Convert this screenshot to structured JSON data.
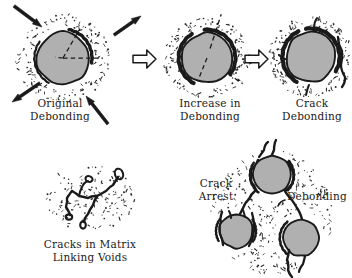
{
  "figure": {
    "background_color": "#ffffff",
    "ink_color": "#1a1a1a",
    "particle_fill": "#b0b0b0",
    "void_color": "#2b2b2b",
    "width": 352,
    "height": 278
  },
  "panels": [
    {
      "id": "original-debonding",
      "caption_line1": "Original",
      "caption_line2": "Debonding",
      "caption_x": 26,
      "caption_y": 97,
      "caption_width": 68,
      "particle": {
        "cx": 63,
        "cy": 58,
        "r": 26
      },
      "void_field": {
        "cx": 63,
        "cy": 58,
        "rx": 48,
        "ry": 44,
        "count": 150
      },
      "debond_arcs": [
        {
          "start_angle": -78,
          "end_angle": 10,
          "offset": 3.0,
          "weight": 3.4
        },
        {
          "start_angle": 120,
          "end_angle": 215,
          "offset": 2.6,
          "weight": 2.2
        }
      ],
      "dashed_lines": [
        {
          "angle": -60,
          "length": 34
        },
        {
          "angle": 0,
          "length": 40
        },
        {
          "angle": 186,
          "length": 8
        }
      ],
      "load_arrows": [
        {
          "x1": 14,
          "y1": 6,
          "x2": 42,
          "y2": 27,
          "dir": "in"
        },
        {
          "x1": 40,
          "y1": 83,
          "x2": 12,
          "y2": 102,
          "dir": "out"
        },
        {
          "x1": 114,
          "y1": 35,
          "x2": 141,
          "y2": 16,
          "dir": "out"
        },
        {
          "x1": 108,
          "y1": 124,
          "x2": 86,
          "y2": 96,
          "dir": "in"
        }
      ]
    },
    {
      "id": "increase-in-debonding",
      "caption_line1": "Increase in",
      "caption_line2": "Debonding",
      "caption_x": 174,
      "caption_y": 97,
      "caption_width": 72,
      "particle": {
        "cx": 207,
        "cy": 58,
        "r": 25
      },
      "void_field": {
        "cx": 207,
        "cy": 58,
        "rx": 44,
        "ry": 40,
        "count": 140
      },
      "debond_arcs": [
        {
          "start_angle": -95,
          "end_angle": 35,
          "offset": 3.4,
          "weight": 4.0
        },
        {
          "start_angle": 118,
          "end_angle": 238,
          "offset": 3.4,
          "weight": 4.0
        }
      ],
      "dashed_lines": [
        {
          "angle": -72,
          "length": 46
        },
        {
          "angle": 112,
          "length": 22
        },
        {
          "angle": 36,
          "length": 44
        }
      ],
      "load_arrows": []
    },
    {
      "id": "crack-debonding",
      "caption_line1": "Crack",
      "caption_line2": "Debonding",
      "caption_x": 278,
      "caption_y": 97,
      "caption_width": 68,
      "particle": {
        "cx": 311,
        "cy": 57,
        "r": 25
      },
      "void_field": {
        "cx": 311,
        "cy": 57,
        "rx": 43,
        "ry": 40,
        "count": 135
      },
      "debond_arcs": [
        {
          "start_angle": -100,
          "end_angle": 30,
          "offset": 3.6,
          "weight": 4.2
        },
        {
          "start_angle": 120,
          "end_angle": 244,
          "offset": 3.6,
          "weight": 4.2
        }
      ],
      "dashed_lines": [],
      "load_arrows": []
    },
    {
      "id": "cracks-in-matrix-linking-voids",
      "caption_line1": "Cracks in Matrix",
      "caption_line2": "Linking Voids",
      "caption_x": 38,
      "caption_y": 238,
      "caption_width": 104,
      "void_field": {
        "cx": 90,
        "cy": 198,
        "rx": 45,
        "ry": 33,
        "count": 135
      },
      "load_arrows": []
    },
    {
      "id": "crack-arrest-debonding",
      "caption_left_line1": "Crack",
      "caption_left_line2": "Arrest",
      "caption_left_x": 192,
      "caption_left_y": 177,
      "caption_left_width": 48,
      "caption_right": "Debonding",
      "caption_right_x": 287,
      "caption_right_y": 190,
      "caption_right_width": 60,
      "void_field": {
        "cx": 272,
        "cy": 212,
        "rx": 62,
        "ry": 62,
        "count": 210
      },
      "particles": [
        {
          "id": "upper-particle",
          "cx": 272,
          "cy": 175,
          "r": 19
        },
        {
          "id": "lower-left-particle",
          "cx": 236,
          "cy": 231,
          "r": 17
        },
        {
          "id": "lower-right-particle",
          "cx": 301,
          "cy": 238,
          "r": 18
        }
      ]
    }
  ],
  "flow_arrows": [
    {
      "id": "flow-arrow-1",
      "x": 133,
      "y": 50,
      "w": 23,
      "h": 18
    },
    {
      "id": "flow-arrow-2",
      "x": 245,
      "y": 50,
      "w": 23,
      "h": 18
    }
  ]
}
